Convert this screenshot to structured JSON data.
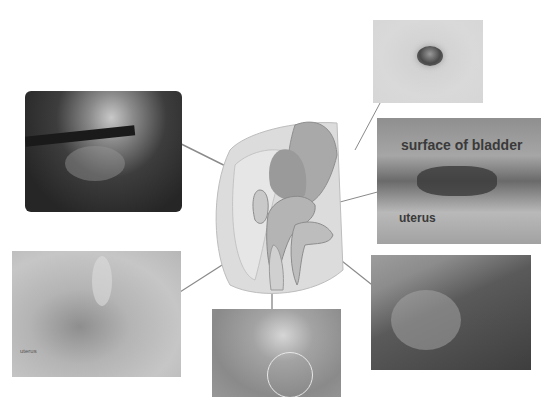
{
  "figure": {
    "type": "anatomical-diagram-with-endoscopic-images",
    "center_diagram": {
      "subject": "sagittal section of female pelvis"
    },
    "panels": [
      {
        "id": "top-left",
        "description": "dark laparoscopic view",
        "labels": []
      },
      {
        "id": "top-right",
        "description": "umbilicus view",
        "labels": []
      },
      {
        "id": "right-middle",
        "description": "laparoscopic view of bladder surface and uterus",
        "labels": [
          "surface of bladder",
          "uterus"
        ]
      },
      {
        "id": "bottom-left",
        "description": "pelvic peritoneum view",
        "labels": [
          "uterus"
        ]
      },
      {
        "id": "bottom-center",
        "description": "vaginal/cervical view with circled region",
        "labels": []
      },
      {
        "id": "bottom-right",
        "description": "dark endoscopic view of rectum",
        "labels": []
      }
    ],
    "colors": {
      "background": "#ffffff",
      "leader_line": "#8a8a8a",
      "label_text": "#3a3a3a"
    }
  }
}
